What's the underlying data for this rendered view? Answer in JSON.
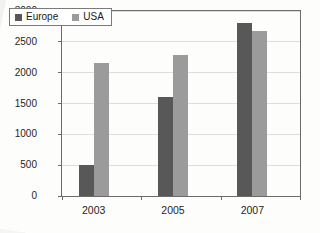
{
  "chart_data": {
    "type": "bar",
    "title": "",
    "subtitle": "",
    "xlabel": "",
    "ylabel": "Billion US$",
    "categories": [
      "2003",
      "2005",
      "2007"
    ],
    "series": [
      {
        "name": "Europe",
        "color": "#585858",
        "values": [
          495,
          1610,
          2800
        ]
      },
      {
        "name": "USA",
        "color": "#9b9b9b",
        "values": [
          2150,
          2285,
          2680
        ]
      }
    ],
    "ylim": [
      0,
      3000
    ],
    "yticks": [
      0,
      500,
      1000,
      1500,
      2000,
      2500,
      3000
    ],
    "ytick_labels": [
      "0",
      "500",
      "1000",
      "1500",
      "2000",
      "2500",
      "3000"
    ],
    "grid": true,
    "grid_axis": "y",
    "legend_position": "top-left",
    "legend_entries": [
      "Europe",
      "USA"
    ]
  },
  "axis": {
    "y_title": "Billion US$",
    "y_labels": [
      "3000",
      "2500",
      "2000",
      "1500",
      "1000",
      "500",
      "0"
    ],
    "x_labels": [
      "2003",
      "2005",
      "2007"
    ]
  },
  "legend": {
    "items": [
      {
        "label": "Europe",
        "swatch": "legend-swatch-dark"
      },
      {
        "label": "USA",
        "swatch": "legend-swatch-light"
      }
    ]
  }
}
